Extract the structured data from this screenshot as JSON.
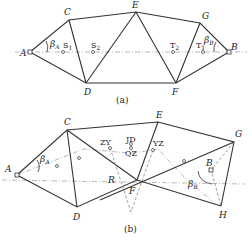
{
  "figure_a": {
    "caption": "(a)",
    "points": {
      "A": "A",
      "B": "B",
      "C": "C",
      "D": "D",
      "E": "E",
      "F": "F",
      "G": "G"
    },
    "beta_a": "β",
    "beta_a_sub": "A",
    "beta_b": "β",
    "beta_b_sub": "B",
    "s1": "S",
    "s1_sub": "1",
    "s2": "S",
    "s2_sub": "2",
    "t1": "T",
    "t1_sub": "1",
    "t2": "T",
    "t2_sub": "2"
  },
  "figure_b": {
    "caption": "(b)",
    "points": {
      "A": "A",
      "B": "B",
      "C": "C",
      "D": "D",
      "E": "E",
      "F": "F",
      "G": "G",
      "H": "H",
      "R": "R"
    },
    "beta_a": "β",
    "beta_a_sub": "A",
    "beta_b": "β",
    "beta_b_sub": "B",
    "zy": "ZY",
    "jd": "JD",
    "qz": "QZ",
    "yz": "YZ"
  }
}
